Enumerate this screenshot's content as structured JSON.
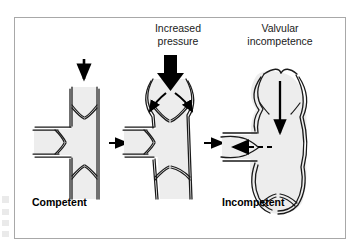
{
  "figure": {
    "type": "medical-illustration",
    "panel_count": 3,
    "colors": {
      "background": "#ffffff",
      "border": "#a8a8a8",
      "vessel_fill": "#ededed",
      "vessel_outline": "#1a1a1a",
      "arrow": "#000000",
      "caption_top": "#1a1a1a",
      "caption_bottom": "#000000"
    }
  },
  "captions": {
    "increased_pressure": "Increased\npressure",
    "valvular_incompetence": "Valvular\nincompetence",
    "competent": "Competent",
    "incompetent": "Incompetent"
  },
  "panels": [
    {
      "id": "panel-competent",
      "label": "Competent",
      "description": "Normal vein with competent valves and competent perforator",
      "arrows": [
        "downward-flow-arrow"
      ]
    },
    {
      "id": "panel-increased-pressure",
      "label": "Increased pressure",
      "description": "Raised venous pressure dilates the valve sinuses so cusps separate",
      "arrows": [
        "thick-pressure-arrow",
        "curved-splay-arrow-left",
        "curved-splay-arrow-right"
      ]
    },
    {
      "id": "panel-incompetent",
      "label": "Incompetent",
      "description": "Grossly dilated varicose vein with incompetent valves and reflux through the blown perforator",
      "arrows": [
        "downward-reflux-arrow",
        "dashed-perforator-reflux-arrow"
      ]
    }
  ],
  "connectors": [
    {
      "id": "connector-1",
      "from": "panel-competent",
      "to": "panel-increased-pressure",
      "glyph": "right-arrow"
    },
    {
      "id": "connector-2",
      "from": "panel-increased-pressure",
      "to": "panel-incompetent",
      "glyph": "right-arrow"
    }
  ]
}
